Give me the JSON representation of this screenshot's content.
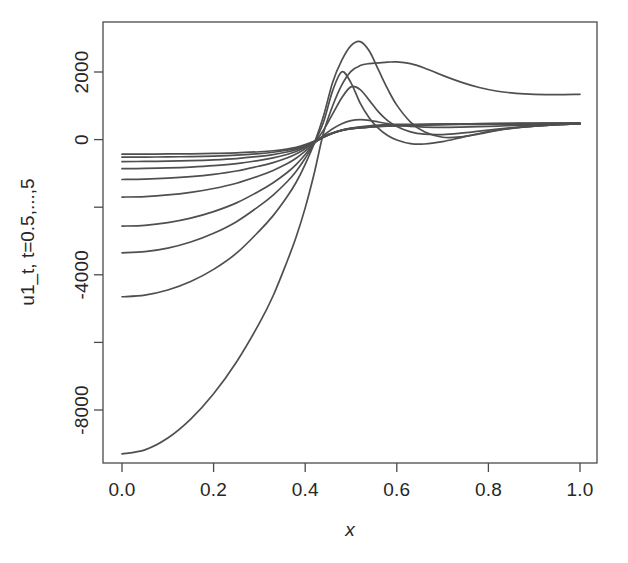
{
  "figure": {
    "background": "#ffffff",
    "curve_color": "#4f4f4f",
    "axis_color": "#4a4a4a"
  },
  "chart_data": {
    "type": "line",
    "title": "",
    "subtitle": "",
    "xlabel": "x",
    "ylabel": "u1_t, t=0.5,...,5",
    "xlim": [
      0.0,
      1.0
    ],
    "ylim": [
      -9600,
      3100
    ],
    "grid": false,
    "legend": false,
    "legend_position": "none",
    "xticks": [
      0.0,
      0.2,
      0.4,
      0.6,
      0.8,
      1.0
    ],
    "xticklabels": [
      "0.0",
      "0.2",
      "0.4",
      "0.6",
      "0.8",
      "1.0"
    ],
    "yticks": [
      2000,
      0,
      -2000,
      -4000,
      -6000,
      -8000
    ],
    "yticklabels": [
      "2000",
      "0",
      "",
      "-4000",
      "",
      "-8000"
    ],
    "x": [
      0.0,
      0.05,
      0.1,
      0.15,
      0.2,
      0.25,
      0.3,
      0.33,
      0.36,
      0.38,
      0.4,
      0.42,
      0.44,
      0.46,
      0.48,
      0.5,
      0.52,
      0.54,
      0.56,
      0.58,
      0.6,
      0.63,
      0.66,
      0.7,
      0.74,
      0.78,
      0.82,
      0.86,
      0.9,
      0.95,
      1.0
    ],
    "series": [
      {
        "name": "t=0.5",
        "values": [
          -430,
          -430,
          -425,
          -420,
          -410,
          -395,
          -360,
          -330,
          -280,
          -230,
          -150,
          -40,
          90,
          200,
          280,
          330,
          360,
          380,
          395,
          408,
          418,
          432,
          443,
          455,
          463,
          470,
          474,
          478,
          481,
          484,
          486
        ]
      },
      {
        "name": "t=1",
        "values": [
          -520,
          -518,
          -512,
          -503,
          -488,
          -462,
          -415,
          -375,
          -315,
          -258,
          -170,
          -55,
          80,
          195,
          275,
          325,
          355,
          375,
          392,
          405,
          415,
          430,
          441,
          453,
          461,
          468,
          472,
          476,
          479,
          482,
          484
        ]
      },
      {
        "name": "t=1.5",
        "values": [
          -650,
          -646,
          -637,
          -622,
          -598,
          -560,
          -495,
          -442,
          -368,
          -298,
          -195,
          -65,
          75,
          190,
          270,
          320,
          350,
          372,
          389,
          402,
          412,
          427,
          438,
          450,
          459,
          466,
          470,
          474,
          477,
          480,
          482
        ]
      },
      {
        "name": "t=2",
        "values": [
          -860,
          -854,
          -838,
          -812,
          -772,
          -712,
          -615,
          -540,
          -440,
          -350,
          -225,
          -75,
          72,
          188,
          268,
          318,
          348,
          370,
          387,
          400,
          410,
          425,
          436,
          448,
          457,
          464,
          468,
          472,
          475,
          478,
          480
        ]
      },
      {
        "name": "t=2.5",
        "values": [
          -1180,
          -1170,
          -1142,
          -1096,
          -1028,
          -930,
          -785,
          -680,
          -545,
          -425,
          -268,
          -88,
          68,
          190,
          280,
          340,
          380,
          410,
          430,
          442,
          448,
          452,
          452,
          450,
          450,
          452,
          456,
          460,
          464,
          468,
          472
        ]
      },
      {
        "name": "t=3",
        "values": [
          -1700,
          -1685,
          -1638,
          -1560,
          -1448,
          -1292,
          -1070,
          -912,
          -718,
          -552,
          -340,
          -100,
          120,
          320,
          470,
          560,
          590,
          570,
          520,
          470,
          430,
          390,
          370,
          360,
          368,
          382,
          400,
          418,
          434,
          452,
          466
        ]
      },
      {
        "name": "t=3.5",
        "values": [
          -2560,
          -2535,
          -2455,
          -2322,
          -2130,
          -1872,
          -1520,
          -1275,
          -982,
          -740,
          -440,
          -110,
          280,
          760,
          1240,
          1560,
          1480,
          1160,
          820,
          560,
          390,
          230,
          160,
          150,
          190,
          250,
          310,
          360,
          400,
          440,
          470
        ]
      },
      {
        "name": "t=4",
        "values": [
          -3350,
          -3316,
          -3210,
          -3030,
          -2772,
          -2428,
          -1962,
          -1640,
          -1255,
          -942,
          -552,
          -100,
          520,
          1450,
          2010,
          1680,
          1080,
          640,
          330,
          120,
          -10,
          -120,
          -130,
          -60,
          60,
          180,
          280,
          350,
          400,
          445,
          470
        ]
      },
      {
        "name": "t=4.5",
        "values": [
          -4650,
          -4600,
          -4450,
          -4200,
          -3840,
          -3360,
          -2700,
          -2250,
          -1700,
          -1270,
          -730,
          -100,
          700,
          1700,
          2350,
          2780,
          2900,
          2620,
          2060,
          1500,
          1020,
          520,
          230,
          70,
          80,
          170,
          270,
          345,
          400,
          445,
          470
        ]
      },
      {
        "name": "t=5",
        "values": [
          -9300,
          -9180,
          -8830,
          -8270,
          -7520,
          -6580,
          -5430,
          -4620,
          -3620,
          -2890,
          -2020,
          -980,
          200,
          1000,
          1620,
          2020,
          2190,
          2250,
          2270,
          2290,
          2300,
          2250,
          2120,
          1900,
          1700,
          1540,
          1430,
          1370,
          1340,
          1330,
          1340
        ]
      }
    ],
    "notes": {
      "crossing_point_x": 0.38,
      "crossing_point_y": 0,
      "n_series": 10,
      "t_values": [
        0.5,
        1,
        1.5,
        2,
        2.5,
        3,
        3.5,
        4,
        4.5,
        5
      ]
    }
  }
}
